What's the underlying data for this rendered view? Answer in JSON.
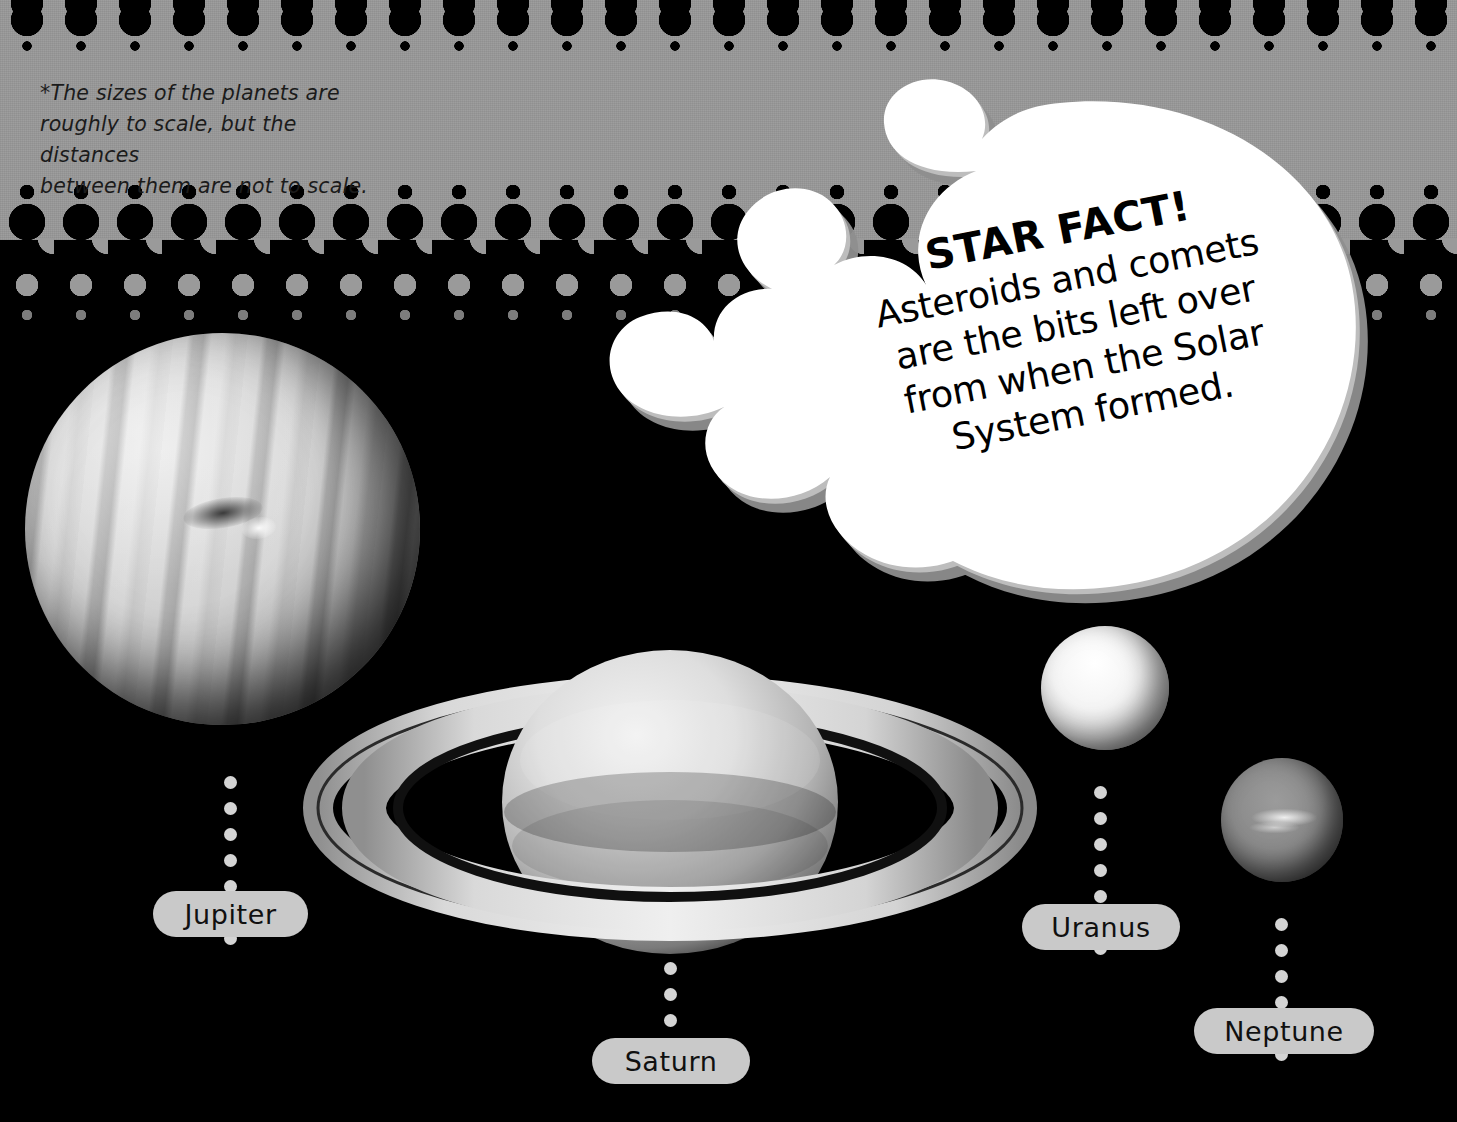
{
  "page": {
    "background_color": "#000000",
    "band_color": "#9a9a9a",
    "pill_color": "#c9c9c9",
    "bubble_color": "#ffffff",
    "bubble_shadow_color": "#8e8e8e"
  },
  "footnote": {
    "line1": "*The sizes of the planets are",
    "line2": "roughly to scale, but the distances",
    "line3": "between them are not to scale."
  },
  "star_fact": {
    "title": "STAR FACT!",
    "line1": "Asteroids and comets",
    "line2": "are the bits left over",
    "line3": "from when the Solar",
    "line4": "System formed."
  },
  "planets": [
    {
      "name": "Jupiter",
      "label": "Jupiter",
      "leader_dots": 7
    },
    {
      "name": "Saturn",
      "label": "Saturn",
      "leader_dots": 4
    },
    {
      "name": "Uranus",
      "label": "Uranus",
      "leader_dots": 7
    },
    {
      "name": "Neptune",
      "label": "Neptune",
      "leader_dots": 6
    }
  ],
  "icons": {
    "comet": "comet-icon",
    "jupiter": "planet-jupiter-icon",
    "saturn": "planet-saturn-icon",
    "uranus": "planet-uranus-icon",
    "neptune": "planet-neptune-icon",
    "halftone": "halftone-dot-pattern"
  }
}
